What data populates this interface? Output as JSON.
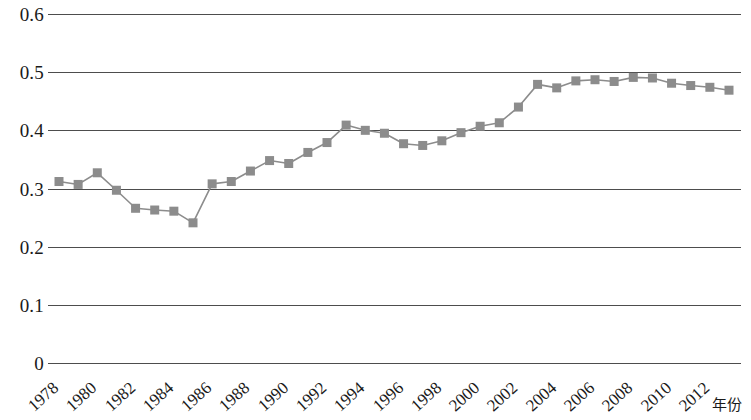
{
  "chart_data": {
    "type": "line",
    "title": "",
    "subtitle": "",
    "xlabel": "年份",
    "ylabel": "",
    "grid": "horizontal-only",
    "legend": "none",
    "marker": "square",
    "marker_color": "#8c8c8c",
    "line_color": "#8c8c8c",
    "xlim": [
      1978,
      2013
    ],
    "ylim": [
      0,
      0.6
    ],
    "ytick_labels": [
      "0.6",
      "0.5",
      "0.4",
      "0.3",
      "0.2",
      "0.1",
      "0"
    ],
    "ytick_values": [
      0.6,
      0.5,
      0.4,
      0.3,
      0.2,
      0.1,
      0
    ],
    "xtick_labels": [
      "1978",
      "1980",
      "1982",
      "1984",
      "1986",
      "1988",
      "1990",
      "1992",
      "1994",
      "1996",
      "1998",
      "2000",
      "2002",
      "2004",
      "2006",
      "2008",
      "2010",
      "2012"
    ],
    "xtick_values": [
      1978,
      1980,
      1982,
      1984,
      1986,
      1988,
      1990,
      1992,
      1994,
      1996,
      1998,
      2000,
      2002,
      2004,
      2006,
      2008,
      2010,
      2012
    ],
    "x": [
      1978,
      1979,
      1980,
      1981,
      1982,
      1983,
      1984,
      1985,
      1986,
      1987,
      1988,
      1989,
      1990,
      1991,
      1992,
      1993,
      1994,
      1995,
      1996,
      1997,
      1998,
      1999,
      2000,
      2001,
      2002,
      2003,
      2004,
      2005,
      2006,
      2007,
      2008,
      2009,
      2010,
      2011,
      2012,
      2013
    ],
    "values": [
      0.312,
      0.307,
      0.327,
      0.297,
      0.266,
      0.263,
      0.261,
      0.241,
      0.308,
      0.312,
      0.33,
      0.348,
      0.343,
      0.362,
      0.379,
      0.409,
      0.4,
      0.395,
      0.377,
      0.374,
      0.382,
      0.396,
      0.407,
      0.413,
      0.44,
      0.479,
      0.473,
      0.485,
      0.487,
      0.484,
      0.491,
      0.49,
      0.481,
      0.477,
      0.474,
      0.469
    ],
    "series": [
      {
        "name": "基尼系数",
        "values": [
          0.312,
          0.307,
          0.327,
          0.297,
          0.266,
          0.263,
          0.261,
          0.241,
          0.308,
          0.312,
          0.33,
          0.348,
          0.343,
          0.362,
          0.379,
          0.409,
          0.4,
          0.395,
          0.377,
          0.374,
          0.382,
          0.396,
          0.407,
          0.413,
          0.44,
          0.479,
          0.473,
          0.485,
          0.487,
          0.484,
          0.491,
          0.49,
          0.481,
          0.477,
          0.474,
          0.469
        ]
      }
    ]
  }
}
